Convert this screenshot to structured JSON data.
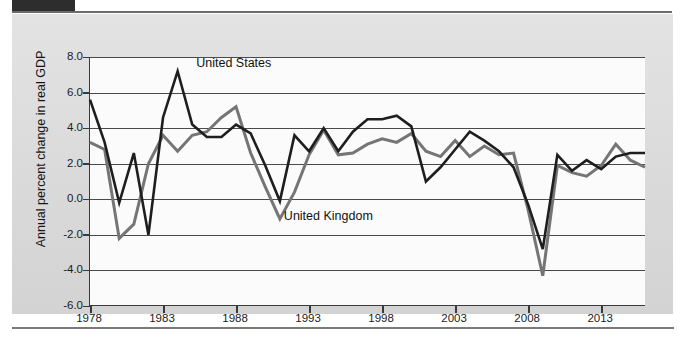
{
  "page": {
    "top_tab_label": "",
    "figure_background": "#dcdcdc"
  },
  "chart_data": {
    "type": "line",
    "title": "",
    "xlabel": "",
    "ylabel": "Annual percent change in real GDP",
    "xlim": [
      1978,
      2016
    ],
    "ylim": [
      -6.0,
      8.0
    ],
    "grid": true,
    "legend_position": "inline-annotations",
    "y_ticks": [
      "8.0",
      "6.0",
      "4.0",
      "2.0",
      "0.0",
      "-2.0",
      "-4.0",
      "-6.0"
    ],
    "y_tick_values": [
      8.0,
      6.0,
      4.0,
      2.0,
      0.0,
      -2.0,
      -4.0,
      -6.0
    ],
    "x_ticks": [
      "1978",
      "1983",
      "1988",
      "1993",
      "1998",
      "2003",
      "2008",
      "2013"
    ],
    "x_tick_values": [
      1978,
      1983,
      1988,
      1993,
      1998,
      2003,
      2008,
      2013
    ],
    "x": [
      1978,
      1979,
      1980,
      1981,
      1982,
      1983,
      1984,
      1985,
      1986,
      1987,
      1988,
      1989,
      1990,
      1991,
      1992,
      1993,
      1994,
      1995,
      1996,
      1997,
      1998,
      1999,
      2000,
      2001,
      2002,
      2003,
      2004,
      2005,
      2006,
      2007,
      2008,
      2009,
      2010,
      2011,
      2012,
      2013,
      2014,
      2015,
      2016
    ],
    "series": [
      {
        "name": "United States",
        "color": "#1e1e1e",
        "label_text": "United States",
        "values": [
          5.6,
          3.2,
          -0.2,
          2.6,
          -2.0,
          4.6,
          7.2,
          4.2,
          3.5,
          3.5,
          4.2,
          3.7,
          1.9,
          -0.1,
          3.6,
          2.7,
          4.0,
          2.7,
          3.8,
          4.5,
          4.5,
          4.7,
          4.1,
          1.0,
          1.8,
          2.8,
          3.8,
          3.3,
          2.7,
          1.8,
          -0.3,
          -2.8,
          2.5,
          1.6,
          2.2,
          1.7,
          2.4,
          2.6,
          2.6
        ]
      },
      {
        "name": "United Kingdom",
        "color": "#757575",
        "label_text": "United Kingdom",
        "values": [
          3.2,
          2.8,
          -2.2,
          -1.4,
          2.0,
          3.6,
          2.7,
          3.6,
          3.8,
          4.6,
          5.2,
          2.6,
          0.7,
          -1.1,
          0.4,
          2.5,
          3.9,
          2.5,
          2.6,
          3.1,
          3.4,
          3.2,
          3.7,
          2.7,
          2.4,
          3.3,
          2.4,
          3.0,
          2.5,
          2.6,
          -0.6,
          -4.3,
          1.9,
          1.5,
          1.3,
          1.9,
          3.1,
          2.2,
          1.8
        ]
      }
    ],
    "annotations": [
      {
        "text": "United States",
        "x_value": 1985,
        "y_value": 7.6
      },
      {
        "text": "United Kingdom",
        "x_value": 1991,
        "y_value": -1.0
      }
    ]
  }
}
